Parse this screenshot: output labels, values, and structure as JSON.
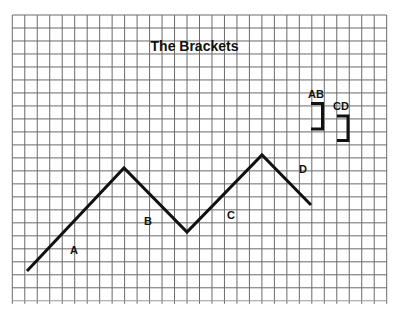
{
  "title": "The Brackets",
  "grid": {
    "x0": 12.3,
    "y0": 15,
    "cols": 30,
    "rows": 22,
    "cell_w": 12.48,
    "cell_h": 12.99,
    "color": "#6a6a6a"
  },
  "zigzag": {
    "color": "#111111",
    "points": [
      [
        27,
        271
      ],
      [
        124,
        168
      ],
      [
        187,
        232
      ],
      [
        262,
        155
      ],
      [
        311,
        205
      ]
    ]
  },
  "labels": [
    {
      "text": "A",
      "x": 74,
      "y": 254
    },
    {
      "text": "B",
      "x": 148,
      "y": 225
    },
    {
      "text": "C",
      "x": 231,
      "y": 219
    },
    {
      "text": "D",
      "x": 303,
      "y": 173
    }
  ],
  "brackets": [
    {
      "label": "AB",
      "label_x": 316,
      "label_y": 98,
      "x_left": 311,
      "x_right": 322.5,
      "y_top": 103.5,
      "y_bottom": 129
    },
    {
      "label": "CD",
      "label_x": 341,
      "label_y": 110,
      "x_left": 337,
      "x_right": 348,
      "y_top": 116,
      "y_bottom": 140.5
    }
  ]
}
